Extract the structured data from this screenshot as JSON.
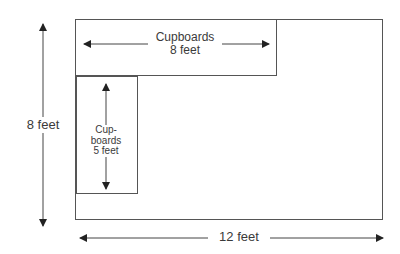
{
  "diagram": {
    "type": "floor-plan",
    "room": {
      "width_label": "12 feet",
      "height_label": "8 feet"
    },
    "cupboards_top": {
      "title": "Cupboards",
      "length": "8 feet"
    },
    "cupboards_left": {
      "title_line1": "Cup-",
      "title_line2": "boards",
      "length": "5 feet"
    },
    "colors": {
      "line": "#555555",
      "arrow": "#222222",
      "text": "#3a3a3a"
    }
  }
}
